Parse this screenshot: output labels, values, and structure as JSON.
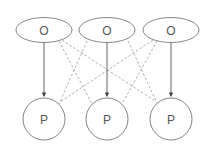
{
  "diagram": {
    "top_nodes": [
      {
        "id": "o1",
        "label": "O",
        "shape": "ellipse",
        "cx": 44,
        "cy": 30,
        "rx": 28,
        "ry": 12.5
      },
      {
        "id": "o2",
        "label": "O",
        "shape": "ellipse",
        "cx": 107,
        "cy": 30,
        "rx": 28,
        "ry": 12.5
      },
      {
        "id": "o3",
        "label": "O",
        "shape": "ellipse",
        "cx": 171,
        "cy": 30,
        "rx": 28,
        "ry": 12.5
      }
    ],
    "bottom_nodes": [
      {
        "id": "p1",
        "label": "P",
        "shape": "circle",
        "cx": 44,
        "cy": 119,
        "r": 21
      },
      {
        "id": "p2",
        "label": "P",
        "shape": "circle",
        "cx": 107,
        "cy": 119,
        "r": 21
      },
      {
        "id": "p3",
        "label": "P",
        "shape": "circle",
        "cx": 171,
        "cy": 119,
        "r": 21
      }
    ],
    "solid_edges": [
      {
        "from": "o1",
        "to": "p1"
      },
      {
        "from": "o2",
        "to": "p2"
      },
      {
        "from": "o3",
        "to": "p3"
      }
    ],
    "dashed_edges": [
      {
        "from": "o1",
        "to": "p2"
      },
      {
        "from": "o1",
        "to": "p3"
      },
      {
        "from": "o2",
        "to": "p1"
      },
      {
        "from": "o2",
        "to": "p3"
      },
      {
        "from": "o3",
        "to": "p1"
      },
      {
        "from": "o3",
        "to": "p2"
      }
    ],
    "colors": {
      "stroke": "#666666",
      "dashed": "#999999",
      "text": "#555555"
    }
  }
}
